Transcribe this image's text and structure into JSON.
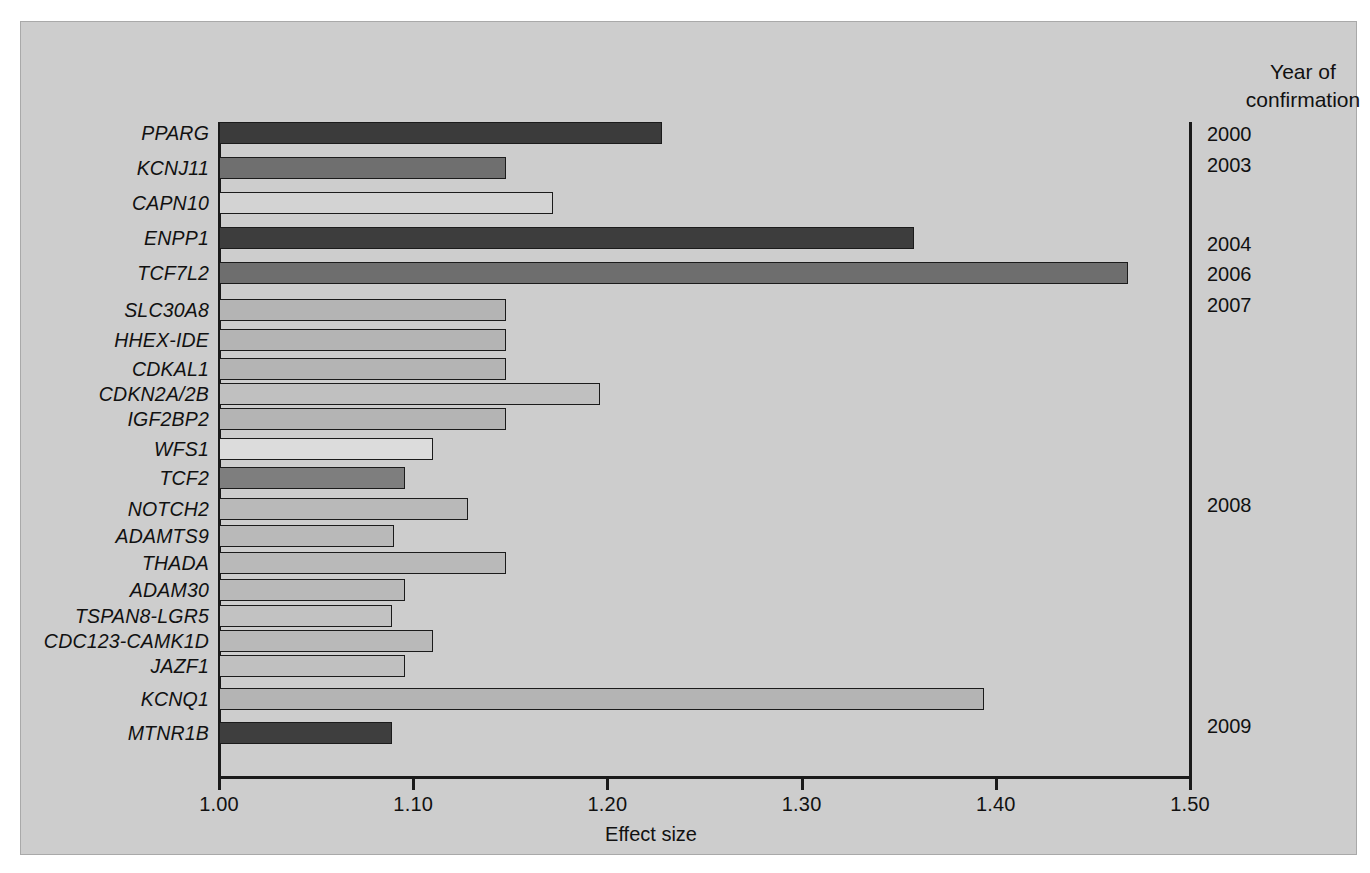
{
  "figure": {
    "background_color": "#cdcdcd",
    "frame_color": "#a9a9a9"
  },
  "axis": {
    "x_title": "Effect size",
    "tick_labels": [
      "1.00",
      "1.10",
      "1.20",
      "1.30",
      "1.40",
      "1.50"
    ]
  },
  "year_column": {
    "header_line1": "Year of",
    "header_line2": "confirmation",
    "entries": [
      {
        "year": "2000",
        "top": 123
      },
      {
        "year": "2003",
        "top": 154
      },
      {
        "year": "2004",
        "top": 233
      },
      {
        "year": "2006",
        "top": 263
      },
      {
        "year": "2007",
        "top": 294
      },
      {
        "year": "2008",
        "top": 494
      },
      {
        "year": "2009",
        "top": 715
      }
    ]
  },
  "chart_data": {
    "type": "bar",
    "orientation": "horizontal",
    "title": "",
    "xlabel": "Effect size",
    "ylabel": "",
    "xlim": [
      1.0,
      1.5
    ],
    "xticks": [
      1.0,
      1.1,
      1.2,
      1.3,
      1.4,
      1.5
    ],
    "grid": false,
    "legend": null,
    "categories": [
      "PPARG",
      "KCNJ11",
      "CAPN10",
      "ENPP1",
      "TCF7L2",
      "SLC30A8",
      "HHEX-IDE",
      "CDKAL1",
      "CDKN2A/2B",
      "IGF2BP2",
      "WFS1",
      "TCF2",
      "NOTCH2",
      "ADAMTS9",
      "THADA",
      "ADAM30",
      "TSPAN8-LGR5",
      "CDC123-CAMK1D",
      "JAZF1",
      "KCNQ1",
      "MTNR1B"
    ],
    "values": [
      1.228,
      1.148,
      1.172,
      1.358,
      1.468,
      1.148,
      1.148,
      1.148,
      1.196,
      1.148,
      1.11,
      1.096,
      1.128,
      1.09,
      1.148,
      1.096,
      1.089,
      1.11,
      1.096,
      1.394,
      1.089
    ],
    "bars": [
      {
        "gene": "PPARG",
        "value": 1.228,
        "color": "#3b3b3b",
        "top": 118,
        "year": "2000"
      },
      {
        "gene": "KCNJ11",
        "value": 1.148,
        "color": "#6f6f6f",
        "top": 153,
        "year": "2003"
      },
      {
        "gene": "CAPN10",
        "value": 1.172,
        "color": "#d3d3d3",
        "top": 188,
        "year": ""
      },
      {
        "gene": "ENPP1",
        "value": 1.358,
        "color": "#3d3d3d",
        "top": 223,
        "year": "2004"
      },
      {
        "gene": "TCF7L2",
        "value": 1.468,
        "color": "#6e6e6e",
        "top": 258,
        "year": "2006"
      },
      {
        "gene": "SLC30A8",
        "value": 1.148,
        "color": "#b4b4b4",
        "top": 295,
        "year": "2007"
      },
      {
        "gene": "HHEX-IDE",
        "value": 1.148,
        "color": "#b4b4b4",
        "top": 325,
        "year": ""
      },
      {
        "gene": "CDKAL1",
        "value": 1.148,
        "color": "#b4b4b4",
        "top": 354,
        "year": ""
      },
      {
        "gene": "CDKN2A/2B",
        "value": 1.196,
        "color": "#c0c0c0",
        "top": 379,
        "year": ""
      },
      {
        "gene": "IGF2BP2",
        "value": 1.148,
        "color": "#b4b4b4",
        "top": 404,
        "year": ""
      },
      {
        "gene": "WFS1",
        "value": 1.11,
        "color": "#dcdcdc",
        "top": 434,
        "year": ""
      },
      {
        "gene": "TCF2",
        "value": 1.096,
        "color": "#7e7e7e",
        "top": 463,
        "year": ""
      },
      {
        "gene": "NOTCH2",
        "value": 1.128,
        "color": "#b9b9b9",
        "top": 494,
        "year": "2008"
      },
      {
        "gene": "ADAMTS9",
        "value": 1.09,
        "color": "#b9b9b9",
        "top": 521,
        "year": ""
      },
      {
        "gene": "THADA",
        "value": 1.148,
        "color": "#b9b9b9",
        "top": 548,
        "year": ""
      },
      {
        "gene": "ADAM30",
        "value": 1.096,
        "color": "#b9b9b9",
        "top": 575,
        "year": ""
      },
      {
        "gene": "TSPAN8-LGR5",
        "value": 1.089,
        "color": "#c2c2c2",
        "top": 601,
        "year": ""
      },
      {
        "gene": "CDC123-CAMK1D",
        "value": 1.11,
        "color": "#b9b9b9",
        "top": 626,
        "year": ""
      },
      {
        "gene": "JAZF1",
        "value": 1.096,
        "color": "#c0c0c0",
        "top": 651,
        "year": ""
      },
      {
        "gene": "KCNQ1",
        "value": 1.394,
        "color": "#b4b4b4",
        "top": 684,
        "year": ""
      },
      {
        "gene": "MTNR1B",
        "value": 1.089,
        "color": "#3e3e3e",
        "top": 718,
        "year": "2009"
      }
    ]
  }
}
